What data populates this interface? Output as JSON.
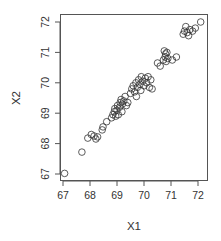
{
  "chart_data": {
    "type": "scatter",
    "title": "",
    "xlabel": "X1",
    "ylabel": "X2",
    "xlim": [
      66.9,
      72.35
    ],
    "ylim": [
      66.8,
      72.3
    ],
    "xticks": [
      67,
      68,
      69,
      70,
      71,
      72
    ],
    "yticks": [
      67,
      68,
      69,
      70,
      71,
      72
    ],
    "grid": false,
    "legend": null,
    "marker": "open-circle",
    "colors": {
      "marker": "#333333",
      "axis": "#555555",
      "frame": "#555555"
    },
    "series": [
      {
        "name": "X1 vs X2",
        "points": [
          [
            67.06,
            67.02
          ],
          [
            67.7,
            67.72
          ],
          [
            67.92,
            68.18
          ],
          [
            68.05,
            68.3
          ],
          [
            68.15,
            68.25
          ],
          [
            68.22,
            68.15
          ],
          [
            68.28,
            68.22
          ],
          [
            68.45,
            68.45
          ],
          [
            68.48,
            68.55
          ],
          [
            68.62,
            68.72
          ],
          [
            68.8,
            68.85
          ],
          [
            68.85,
            68.95
          ],
          [
            68.9,
            69.05
          ],
          [
            68.95,
            68.9
          ],
          [
            69.0,
            69.1
          ],
          [
            69.05,
            68.95
          ],
          [
            69.1,
            69.2
          ],
          [
            69.12,
            69.35
          ],
          [
            69.15,
            69.45
          ],
          [
            69.2,
            69.3
          ],
          [
            69.25,
            69.4
          ],
          [
            69.3,
            69.55
          ],
          [
            69.35,
            69.25
          ],
          [
            69.4,
            69.35
          ],
          [
            69.02,
            69.25
          ],
          [
            69.18,
            69.05
          ],
          [
            68.92,
            69.15
          ],
          [
            69.5,
            69.65
          ],
          [
            69.55,
            69.8
          ],
          [
            69.6,
            69.9
          ],
          [
            69.65,
            69.7
          ],
          [
            69.7,
            70.0
          ],
          [
            69.75,
            69.85
          ],
          [
            69.8,
            70.1
          ],
          [
            69.85,
            69.95
          ],
          [
            69.9,
            70.2
          ],
          [
            69.95,
            70.05
          ],
          [
            70.0,
            69.9
          ],
          [
            70.05,
            70.15
          ],
          [
            70.1,
            70.0
          ],
          [
            70.15,
            70.2
          ],
          [
            70.2,
            69.85
          ],
          [
            70.25,
            70.1
          ],
          [
            69.72,
            69.55
          ],
          [
            69.88,
            69.75
          ],
          [
            70.3,
            69.8
          ],
          [
            70.5,
            70.65
          ],
          [
            70.6,
            70.55
          ],
          [
            70.72,
            70.75
          ],
          [
            70.78,
            70.85
          ],
          [
            70.8,
            70.95
          ],
          [
            70.85,
            71.0
          ],
          [
            70.82,
            70.7
          ],
          [
            70.88,
            70.8
          ],
          [
            71.05,
            70.75
          ],
          [
            71.2,
            70.85
          ],
          [
            70.75,
            71.05
          ],
          [
            71.45,
            71.6
          ],
          [
            71.5,
            71.7
          ],
          [
            71.55,
            71.85
          ],
          [
            71.6,
            71.65
          ],
          [
            71.65,
            71.55
          ],
          [
            71.7,
            71.75
          ],
          [
            71.8,
            71.7
          ],
          [
            71.9,
            71.8
          ],
          [
            72.1,
            72.0
          ]
        ]
      }
    ]
  }
}
